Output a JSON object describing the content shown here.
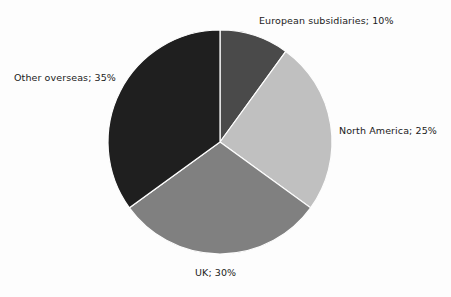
{
  "chart_data": {
    "type": "pie",
    "title": "",
    "subtitle": "",
    "xlabel": "",
    "ylabel": "",
    "legend_position": "none",
    "grid": false,
    "label_format": "category; percent",
    "start_angle_deg": 0,
    "direction": "clockwise",
    "categories": [
      "European subsidiaries",
      "North America",
      "UK",
      "Other overseas"
    ],
    "values": [
      10,
      25,
      30,
      35
    ],
    "value_unit": "%",
    "slices": [
      {
        "label": "European subsidiaries",
        "value": 10,
        "display": "European subsidiaries; 10%",
        "color": "#4a4a4a",
        "start_deg": 0,
        "end_deg": 36
      },
      {
        "label": "North America",
        "value": 25,
        "display": "North America; 25%",
        "color": "#c0c0c0",
        "start_deg": 36,
        "end_deg": 126
      },
      {
        "label": "UK",
        "value": 30,
        "display": "UK; 30%",
        "color": "#808080",
        "start_deg": 126,
        "end_deg": 234
      },
      {
        "label": "Other overseas",
        "value": 35,
        "display": "Other overseas; 35%",
        "color": "#1f1f1f",
        "start_deg": 234,
        "end_deg": 360
      }
    ]
  },
  "figure": {
    "background_color": "#fdfdfd",
    "text_color": "#1b1b1b",
    "center_x": 220,
    "center_y": 142,
    "radius": 112,
    "separator_color": "#fdfdfd"
  }
}
